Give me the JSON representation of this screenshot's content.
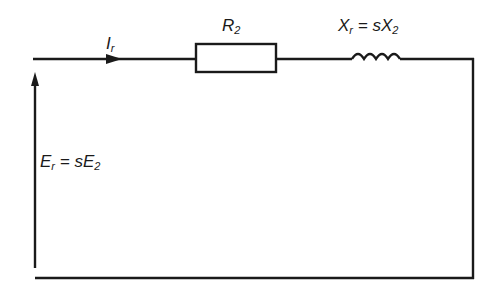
{
  "diagram": {
    "type": "equivalent-circuit",
    "current_label": {
      "main": "I",
      "sub": "r"
    },
    "resistor_label": {
      "main": "R",
      "sub": "2"
    },
    "reactance_label": {
      "main": "X",
      "sub": "r",
      "eq": " = sX",
      "sub2": "2"
    },
    "emf_label": {
      "main": "E",
      "sub": "r",
      "eq": " = sE",
      "sub2": "2"
    },
    "stroke_color": "#1a1a1a"
  }
}
